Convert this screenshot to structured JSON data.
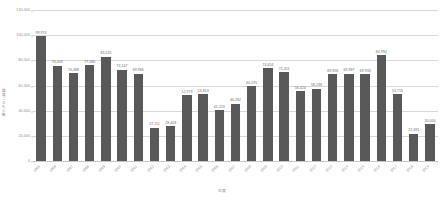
{
  "chart_data": {
    "type": "bar",
    "title": "",
    "subtitle": "",
    "xlabel": "年度",
    "ylabel": "職員こども人数",
    "ylim": [
      0,
      120000
    ],
    "ytick_labels": [
      "0",
      "20,000",
      "40,000",
      "60,000",
      "80,000",
      "100,000",
      "120,000"
    ],
    "ytick_values": [
      0,
      20000,
      40000,
      60000,
      80000,
      100000,
      120000
    ],
    "grid": true,
    "legend": false,
    "bar_color": "#595959",
    "grid_color": "#d9d9d9",
    "categories": [
      "1995",
      "1996",
      "1997",
      "1998",
      "1999",
      "2000",
      "2001",
      "2002",
      "2003",
      "2004",
      "2005",
      "2006",
      "2007",
      "2008",
      "2009",
      "2010",
      "2011",
      "2012",
      "2013",
      "2014",
      "2015",
      "2016",
      "2017",
      "2018",
      "2019"
    ],
    "values": [
      99974,
      76403,
      70488,
      77080,
      83525,
      73147,
      69986,
      27111,
      28403,
      52973,
      53813,
      41223,
      46282,
      60191,
      74654,
      71311,
      56424,
      58238,
      69926,
      69987,
      69933,
      84994,
      53716,
      22491,
      30000
    ],
    "value_labels": [
      "99,974",
      "76,403",
      "70,488",
      "77,080",
      "83,525",
      "73,147",
      "69,986",
      "27,111",
      "28,403",
      "52,973",
      "53,813",
      "41,223",
      "46,282",
      "60,191",
      "74,654",
      "71,311",
      "56,424",
      "58,238",
      "69,926",
      "69,987",
      "69,933",
      "84,994",
      "53,716",
      "22,491",
      "30,000"
    ]
  }
}
